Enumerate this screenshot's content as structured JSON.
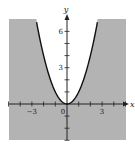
{
  "chart_data": {
    "type": "area",
    "title": "",
    "xlabel": "x",
    "ylabel": "y",
    "xlim": [
      -5,
      5
    ],
    "ylim": [
      -3,
      7
    ],
    "curve": {
      "equation": "y = x^2",
      "style": "solid",
      "x_range": [
        -2.6,
        2.6
      ]
    },
    "shaded_region": "y < x^2",
    "x_ticks": [
      -5,
      -4,
      -3,
      -2,
      -1,
      1,
      2,
      3,
      4,
      5
    ],
    "y_ticks": [
      -3,
      -2,
      -1,
      1,
      2,
      3,
      4,
      5,
      6
    ],
    "x_tick_labels": [
      {
        "value": -3,
        "text": "−3"
      },
      {
        "value": 0,
        "text": "0"
      },
      {
        "value": 3,
        "text": "3"
      }
    ],
    "y_tick_labels": [
      {
        "value": 3,
        "text": "3"
      },
      {
        "value": 6,
        "text": "6"
      }
    ],
    "grid": false,
    "colors": {
      "shade": "#b3b3b3",
      "curve": "#111111",
      "axis": "#222222",
      "background": "#ffffff"
    }
  }
}
